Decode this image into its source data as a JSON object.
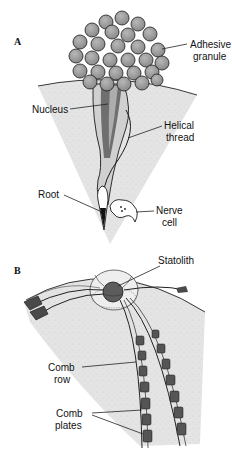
{
  "figure": {
    "panels": [
      {
        "id": "A",
        "letter": "A",
        "labels": {
          "adhesive_granule": [
            "Adhesive",
            "granule"
          ],
          "nucleus": "Nucleus",
          "helical_thread": [
            "Helical",
            "thread"
          ],
          "root": "Root",
          "nerve_cell": [
            "Nerve",
            "cell"
          ]
        }
      },
      {
        "id": "B",
        "letter": "B",
        "labels": {
          "statolith": "Statolith",
          "comb_row": [
            "Comb",
            "row"
          ],
          "comb_plates": [
            "Comb",
            "plates"
          ]
        }
      }
    ],
    "colors": {
      "tissue": "#e6e6e6",
      "granule": "#9a9a9a",
      "nucleus": "#6f6f6f",
      "statolith": "#5c5c5c",
      "outline": "#1a1a1a"
    }
  }
}
